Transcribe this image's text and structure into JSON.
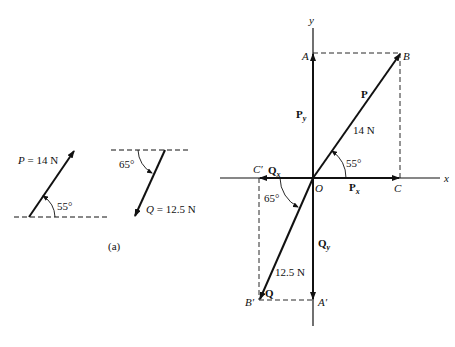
{
  "figure_a": {
    "caption": "(a)",
    "P": {
      "label": "P",
      "eq": " = 14 N",
      "angle": "55°"
    },
    "Q": {
      "label": "Q",
      "eq": " = 12.5 N",
      "angle": "65°"
    }
  },
  "figure_b": {
    "axes": {
      "x": "x",
      "y": "y",
      "origin": "O"
    },
    "points": {
      "A": "A",
      "B": "B",
      "C": "C",
      "A_prime": "A′",
      "B_prime": "B′",
      "C_prime": "C′"
    },
    "vectors": {
      "P": {
        "label": "P",
        "magnitude": "14 N",
        "angle": "55°"
      },
      "Px": {
        "label": "P",
        "sub": "x"
      },
      "Py": {
        "label": "P",
        "sub": "y"
      },
      "Q": {
        "label": "Q",
        "magnitude": "12.5 N",
        "angle": "65°"
      },
      "Qx": {
        "label": "Q",
        "sub": "x"
      },
      "Qy": {
        "label": "Q",
        "sub": "y"
      }
    }
  }
}
